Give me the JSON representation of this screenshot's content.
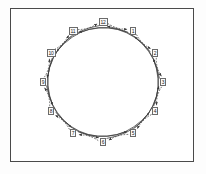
{
  "figure": {
    "border_color": "#4a4a4a",
    "background_color": "#ffffff",
    "edge_color": "#3a3a3a",
    "node_border_color": "#6b6b6b",
    "node_fill_color": "#fafafa"
  },
  "chart_data": {
    "type": "diagram",
    "layout": "circular",
    "node_count": 12,
    "center": {
      "x": 103,
      "y": 82
    },
    "radius": 60,
    "nodes": [
      {
        "id": 1,
        "label": "1",
        "x": 133,
        "y": 31,
        "angle_deg": -60
      },
      {
        "id": 2,
        "label": "2",
        "x": 155,
        "y": 53,
        "angle_deg": -30
      },
      {
        "id": 3,
        "label": "3",
        "x": 163,
        "y": 82,
        "angle_deg": 0
      },
      {
        "id": 4,
        "label": "4",
        "x": 155,
        "y": 111,
        "angle_deg": 30
      },
      {
        "id": 5,
        "label": "5",
        "x": 133,
        "y": 133,
        "angle_deg": 60
      },
      {
        "id": 6,
        "label": "6",
        "x": 103,
        "y": 142,
        "angle_deg": 90
      },
      {
        "id": 7,
        "label": "7",
        "x": 73,
        "y": 133,
        "angle_deg": 120
      },
      {
        "id": 8,
        "label": "8",
        "x": 51,
        "y": 111,
        "angle_deg": 150
      },
      {
        "id": 9,
        "label": "9",
        "x": 43,
        "y": 82,
        "angle_deg": 180
      },
      {
        "id": 10,
        "label": "10",
        "x": 51,
        "y": 53,
        "angle_deg": 210
      },
      {
        "id": 11,
        "label": "11",
        "x": 73,
        "y": 31,
        "angle_deg": 240
      },
      {
        "id": 12,
        "label": "12",
        "x": 103,
        "y": 22,
        "angle_deg": 270
      }
    ],
    "edge_sets": [
      {
        "name": "adjacent-dashed-cycle",
        "style": "dashed",
        "directed": true,
        "chord_step": 1,
        "edges": [
          [
            12,
            1
          ],
          [
            1,
            2
          ],
          [
            2,
            3
          ],
          [
            3,
            4
          ],
          [
            4,
            5
          ],
          [
            5,
            6
          ],
          [
            6,
            7
          ],
          [
            7,
            8
          ],
          [
            8,
            9
          ],
          [
            9,
            10
          ],
          [
            10,
            11
          ],
          [
            11,
            12
          ]
        ]
      },
      {
        "name": "long-range-solid-arcs",
        "style": "solid",
        "directed": true,
        "chord_step": 3,
        "edges": [
          [
            1,
            10
          ],
          [
            2,
            11
          ],
          [
            3,
            12
          ],
          [
            4,
            1
          ],
          [
            5,
            2
          ],
          [
            6,
            3
          ],
          [
            7,
            4
          ],
          [
            8,
            5
          ],
          [
            9,
            6
          ],
          [
            10,
            7
          ],
          [
            11,
            8
          ],
          [
            12,
            9
          ]
        ]
      }
    ],
    "xlabel": "",
    "ylabel": "",
    "legend": []
  }
}
